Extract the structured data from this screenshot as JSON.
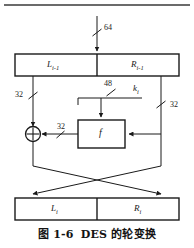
{
  "figure": {
    "caption_number": "图 1-6",
    "caption_title": "DES 的轮变换",
    "top_rule": true
  },
  "diagram": {
    "type": "block-diagram",
    "input": {
      "bitwidth_label": "64",
      "slash_marker": true
    },
    "input_register": {
      "left_label": "L",
      "left_sub": "i-1",
      "right_label": "R",
      "right_sub": "i-1"
    },
    "output_register": {
      "left_label": "L",
      "left_sub": "i",
      "right_label": "R",
      "right_sub": "i"
    },
    "branch_labels": {
      "left_32": "32",
      "right_32": "32",
      "f_output_32": "32",
      "key_48": "48"
    },
    "subkey": {
      "label": "k",
      "sub": "i"
    },
    "function_box": {
      "label": "f"
    },
    "xor": {
      "symbol": "+",
      "name": "exclusive-or"
    },
    "colors": {
      "stroke": "#1a1a1a",
      "text": "#1a1a1a",
      "background": "#ffffff",
      "rule": "#6b6b6b"
    }
  }
}
